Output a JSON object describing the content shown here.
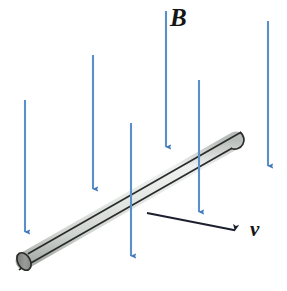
{
  "figure": {
    "background_color": "#ffffff",
    "width": 287,
    "height": 291
  },
  "labels": {
    "magnetic_field": "B",
    "velocity": "v"
  },
  "colors": {
    "field_arrow": "#5b8fc7",
    "field_arrow_dark": "#3f78bb",
    "rod_body": "#dfe3e0",
    "rod_outline": "#2b2b2b",
    "rod_cap": "#8d8f8d",
    "velocity_arrow": "#1b1f2e",
    "label_text": "#151515"
  },
  "field_arrows": [
    {
      "name": "field-arrow-1",
      "x1": 25,
      "y1": 100,
      "x2": 25,
      "y2": 243
    },
    {
      "name": "field-arrow-2",
      "x1": 93,
      "y1": 55,
      "x2": 93,
      "y2": 200
    },
    {
      "name": "field-arrow-3",
      "x1": 131,
      "y1": 123,
      "x2": 131,
      "y2": 267
    },
    {
      "name": "field-arrow-4",
      "x1": 166,
      "y1": 11,
      "x2": 166,
      "y2": 158
    },
    {
      "name": "field-arrow-5",
      "x1": 199,
      "y1": 80,
      "x2": 199,
      "y2": 223
    },
    {
      "name": "field-arrow-6",
      "x1": 268,
      "y1": 21,
      "x2": 268,
      "y2": 177
    }
  ],
  "rod": {
    "name": "conducting-rod",
    "start": {
      "x": 22,
      "y": 262
    },
    "end": {
      "x": 238,
      "y": 139
    },
    "thickness": 17
  },
  "velocity_arrow": {
    "name": "velocity-arrow",
    "x1": 147,
    "y1": 213,
    "x2": 244,
    "y2": 232
  }
}
